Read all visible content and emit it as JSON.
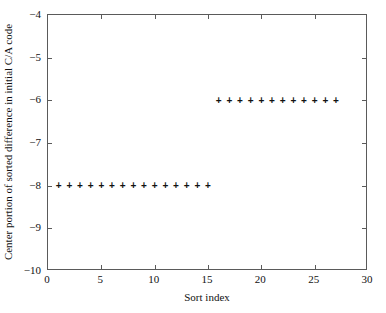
{
  "chart_data": {
    "type": "scatter",
    "title": "",
    "xlabel": "Sort index",
    "ylabel": "Center portion of sorted difference in initial C/A code",
    "xlim": [
      0,
      30
    ],
    "ylim": [
      -10,
      -4
    ],
    "xticks": [
      0,
      5,
      10,
      15,
      20,
      25,
      30
    ],
    "xtick_labels": [
      "0",
      "5",
      "10",
      "15",
      "20",
      "25",
      "30"
    ],
    "yticks": [
      -10,
      -9,
      -8,
      -7,
      -6,
      -5,
      -4
    ],
    "ytick_labels": [
      "-10",
      "-9",
      "-8",
      "-7",
      "-6",
      "-5",
      "-4"
    ],
    "grid": false,
    "legend": null,
    "marker": "plus",
    "marker_color": "#111111",
    "series": [
      {
        "name": "Center portion of sorted difference",
        "x": [
          1,
          2,
          3,
          4,
          5,
          6,
          7,
          8,
          9,
          10,
          11,
          12,
          13,
          14,
          15,
          16,
          17,
          18,
          19,
          20,
          21,
          22,
          23,
          24,
          25,
          26,
          27
        ],
        "y": [
          -8,
          -8,
          -8,
          -8,
          -8,
          -8,
          -8,
          -8,
          -8,
          -8,
          -8,
          -8,
          -8,
          -8,
          -8,
          -6,
          -6,
          -6,
          -6,
          -6,
          -6,
          -6,
          -6,
          -6,
          -6,
          -6,
          -6
        ]
      }
    ],
    "groups": [
      {
        "value": -8,
        "index_start": 1,
        "index_end": 15,
        "count": 15
      },
      {
        "value": -6,
        "index_start": 16,
        "index_end": 27,
        "count": 12
      }
    ],
    "axes_color": "#5a5a5a",
    "background": "#ffffff"
  }
}
